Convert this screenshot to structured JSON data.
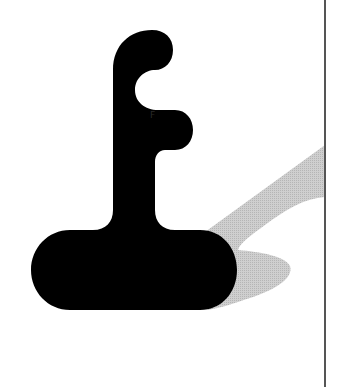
{
  "artwork": {
    "description": "Stylized black letter-like joystick shape with gray cast shadow",
    "shape_color": "#000000",
    "shadow_color": "#c4c4c4",
    "background_color": "#ffffff",
    "rule_color": "#555555",
    "inner_glyph": "F"
  }
}
